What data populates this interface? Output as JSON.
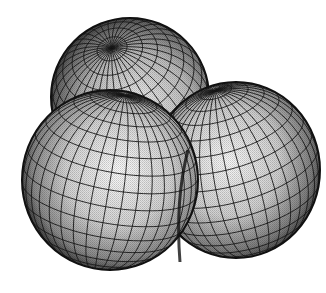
{
  "figure": {
    "title": "",
    "lobes": [
      {
        "name": "top-back-lobe"
      },
      {
        "name": "front-left-lobe"
      },
      {
        "name": "right-lobe"
      }
    ],
    "colors": {
      "background": "#ffffff",
      "mesh_line": "#1a1a1a",
      "highlight": "#f4f4f4",
      "midtone": "#b5b5b5",
      "shadow": "#2a2a2a"
    }
  }
}
